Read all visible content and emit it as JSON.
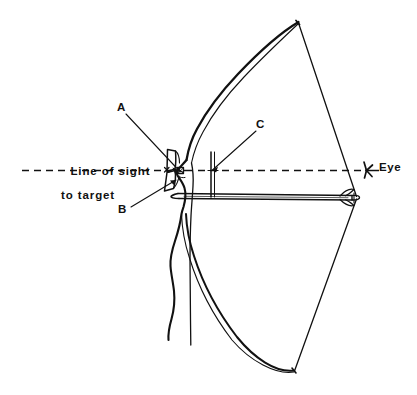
{
  "figure": {
    "background_color": "#ffffff",
    "ink_color": "#111111",
    "width": 417,
    "height": 395
  },
  "labels": {
    "a": "A",
    "b": "B",
    "c": "C",
    "line_of_sight_1": "Line of sight",
    "line_of_sight_2": "to target",
    "eye": "Eye"
  },
  "icons": {
    "eye_marker": "eye-icon",
    "sight_line": "dashed-sight-line",
    "bow": "bow-outline",
    "arrow": "arrow-shaft",
    "string": "bow-string"
  }
}
